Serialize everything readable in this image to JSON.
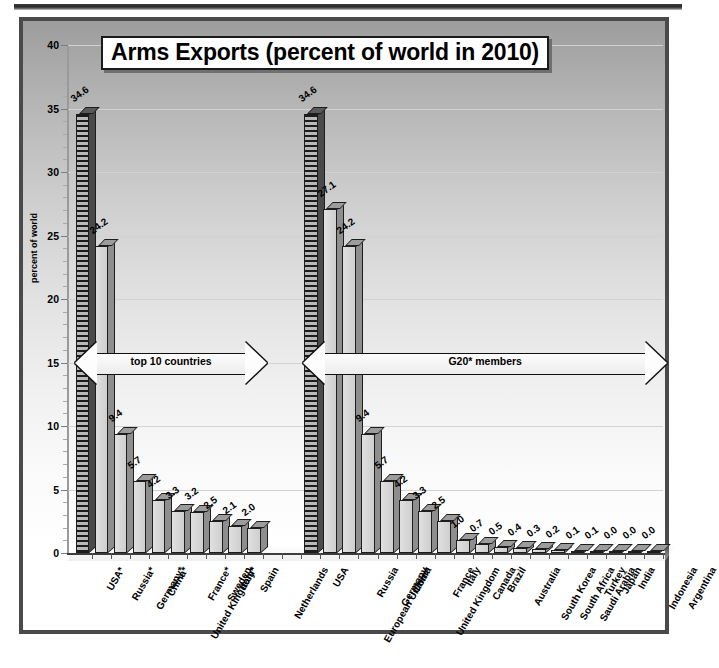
{
  "chart_data": {
    "type": "bar",
    "title": "Arms Exports (percent of world in 2010)",
    "xlabel": "",
    "ylabel": "percent of world",
    "ylim": [
      0,
      40
    ],
    "ytick_values": [
      0,
      5,
      10,
      15,
      20,
      25,
      30,
      35,
      40
    ],
    "grid": true,
    "legend": "none",
    "groups": [
      {
        "name": "top 10 countries",
        "annotation": "top 10 countries",
        "categories": [
          "USA*",
          "Russia*",
          "Germany*",
          "China*",
          "United Kingdom*",
          "France*",
          "Sweden",
          "Italy*",
          "Spain",
          "Netherlands"
        ],
        "values": [
          34.6,
          24.2,
          9.4,
          5.7,
          4.2,
          3.3,
          3.2,
          2.5,
          2.1,
          2.0
        ]
      },
      {
        "name": "G20* members",
        "annotation": "G20* members",
        "categories": [
          "USA",
          "European Union**",
          "Russia",
          "Germany",
          "China",
          "United Kingdom",
          "France",
          "Italy",
          "Canada",
          "Brazil",
          "Australia",
          "South Korea",
          "South Africa",
          "Saudi Arabia",
          "Turkey",
          "Japan",
          "India",
          "Indonesia",
          "Argentina"
        ],
        "values": [
          34.6,
          27.1,
          24.2,
          9.4,
          5.7,
          4.2,
          3.3,
          2.5,
          1.0,
          0.7,
          0.5,
          0.4,
          0.3,
          0.2,
          0.1,
          0.1,
          0.0,
          0.0,
          0.0
        ]
      }
    ]
  },
  "title": {
    "text": "Arms Exports (percent of world in 2010)"
  },
  "axes": {
    "y_title": "percent of world",
    "y_ticks": [
      "0",
      "5",
      "10",
      "15",
      "20",
      "25",
      "30",
      "35",
      "40"
    ]
  },
  "annotations": {
    "left_arrow": "top 10 countries",
    "right_arrow": "G20* members"
  },
  "colors": {
    "frame": "#4a4a4a",
    "bar_fill": "#d6d6d6",
    "bar_side": "#8e8e8e",
    "bar_outline": "#1d1d1d",
    "highlight_bar": "#1c1c1c",
    "gridline": "#d2d2d2",
    "text": "#000000"
  }
}
